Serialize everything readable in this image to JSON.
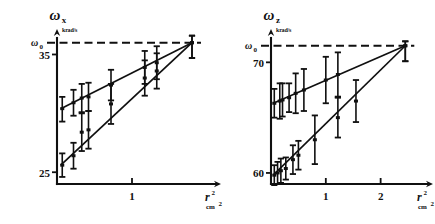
{
  "figure": {
    "title": "",
    "panels": [
      {
        "id": "left",
        "y_axis_name": "ω",
        "y_axis_subscript": "x",
        "y_axis_unit": "krad/s",
        "y_ref_label": "ω",
        "y_ref_subscript": "0",
        "y_tick_label": "35",
        "y_bottom_label": "25",
        "x_axis_name": "r",
        "x_axis_exponent": "2",
        "x_axis_unit": "cm",
        "x_axis_unit_exponent": "2",
        "x_tick_labels": [
          "1"
        ]
      },
      {
        "id": "right",
        "y_axis_name": "ω",
        "y_axis_subscript": "z",
        "y_axis_unit": "krad/s",
        "y_ref_label": "ω",
        "y_ref_subscript": "0",
        "y_tick_label": "70",
        "y_bottom_label": "60",
        "x_axis_name": "r",
        "x_axis_exponent": "2",
        "x_axis_unit": "cm",
        "x_axis_unit_exponent": "2",
        "x_tick_labels": [
          "1",
          "2"
        ]
      }
    ]
  },
  "chart_data": [
    {
      "type": "scatter",
      "id": "left-panel",
      "title": "",
      "xlabel": "r² (cm²)",
      "ylabel": "ωx (krad/s)",
      "xlim": [
        0,
        2.0
      ],
      "ylim": [
        24.0,
        36.4
      ],
      "grid": false,
      "legend": "none",
      "reference_line": {
        "label": "ω0",
        "value": 36.0,
        "style": "dashed",
        "orientation": "horizontal"
      },
      "y_ticks": [
        25,
        35
      ],
      "x_ticks": [
        1
      ],
      "series": [
        {
          "name": "upper-branch",
          "fit_line": {
            "x": [
              0.05,
              1.8
            ],
            "y": [
              30.4,
              36.0
            ]
          },
          "points": [
            {
              "x": 0.07,
              "y": 30.4,
              "yerr_low": 1.1,
              "yerr_high": 1.0
            },
            {
              "x": 0.22,
              "y": 30.9,
              "yerr_low": 1.1,
              "yerr_high": 1.1
            },
            {
              "x": 0.33,
              "y": 31.3,
              "yerr_low": 1.2,
              "yerr_high": 1.2
            },
            {
              "x": 0.42,
              "y": 31.4,
              "yerr_low": 1.2,
              "yerr_high": 1.2
            },
            {
              "x": 0.72,
              "y": 32.4,
              "yerr_low": 1.3,
              "yerr_high": 1.3
            },
            {
              "x": 1.17,
              "y": 33.9,
              "yerr_low": 1.4,
              "yerr_high": 1.4
            },
            {
              "x": 1.33,
              "y": 34.3,
              "yerr_low": 1.4,
              "yerr_high": 1.4
            },
            {
              "x": 1.8,
              "y": 36.0,
              "yerr_low": 1.3,
              "yerr_high": 0.6
            }
          ]
        },
        {
          "name": "lower-branch",
          "fit_line": {
            "x": [
              0.05,
              1.8
            ],
            "y": [
              25.6,
              36.0
            ]
          },
          "points": [
            {
              "x": 0.07,
              "y": 25.6,
              "yerr_low": 1.0,
              "yerr_high": 1.0
            },
            {
              "x": 0.22,
              "y": 26.4,
              "yerr_low": 1.1,
              "yerr_high": 1.1
            },
            {
              "x": 0.33,
              "y": 28.4,
              "yerr_low": 1.6,
              "yerr_high": 1.6
            },
            {
              "x": 0.42,
              "y": 28.6,
              "yerr_low": 1.6,
              "yerr_high": 1.6
            },
            {
              "x": 0.72,
              "y": 30.8,
              "yerr_low": 1.7,
              "yerr_high": 1.7
            },
            {
              "x": 1.17,
              "y": 33.0,
              "yerr_low": 1.5,
              "yerr_high": 1.5
            },
            {
              "x": 1.33,
              "y": 33.6,
              "yerr_low": 1.5,
              "yerr_high": 1.5
            },
            {
              "x": 1.8,
              "y": 36.0,
              "yerr_low": 1.3,
              "yerr_high": 0.6
            }
          ]
        }
      ]
    },
    {
      "type": "scatter",
      "id": "right-panel",
      "title": "",
      "xlabel": "r² (cm²)",
      "ylabel": "ωz (krad/s)",
      "xlim": [
        0,
        2.7
      ],
      "ylim": [
        59.0,
        72.2
      ],
      "grid": false,
      "legend": "none",
      "reference_line": {
        "label": "ω0",
        "value": 71.5,
        "style": "dashed",
        "orientation": "horizontal"
      },
      "y_ticks": [
        60,
        70
      ],
      "x_ticks": [
        1,
        2
      ],
      "series": [
        {
          "name": "upper-branch",
          "fit_line": {
            "x": [
              0.04,
              2.45
            ],
            "y": [
              66.3,
              71.5
            ]
          },
          "points": [
            {
              "x": 0.06,
              "y": 66.3,
              "yerr_low": 1.3,
              "yerr_high": 1.3
            },
            {
              "x": 0.16,
              "y": 66.5,
              "yerr_low": 1.6,
              "yerr_high": 1.6
            },
            {
              "x": 0.21,
              "y": 66.6,
              "yerr_low": 1.5,
              "yerr_high": 1.5
            },
            {
              "x": 0.33,
              "y": 66.8,
              "yerr_low": 1.3,
              "yerr_high": 1.3
            },
            {
              "x": 0.45,
              "y": 67.2,
              "yerr_low": 1.8,
              "yerr_high": 1.8
            },
            {
              "x": 0.6,
              "y": 67.5,
              "yerr_low": 1.9,
              "yerr_high": 1.9
            },
            {
              "x": 1.0,
              "y": 68.4,
              "yerr_low": 2.1,
              "yerr_high": 2.1
            },
            {
              "x": 1.22,
              "y": 68.9,
              "yerr_low": 2.0,
              "yerr_high": 2.0
            },
            {
              "x": 2.45,
              "y": 71.5,
              "yerr_low": 1.4,
              "yerr_high": 0.4
            }
          ]
        },
        {
          "name": "lower-branch",
          "fit_line": {
            "x": [
              0.04,
              2.45
            ],
            "y": [
              59.8,
              71.5
            ]
          },
          "points": [
            {
              "x": 0.06,
              "y": 59.8,
              "yerr_low": 0.9,
              "yerr_high": 0.9
            },
            {
              "x": 0.12,
              "y": 60.0,
              "yerr_low": 1.0,
              "yerr_high": 1.0
            },
            {
              "x": 0.18,
              "y": 60.2,
              "yerr_low": 1.1,
              "yerr_high": 1.1
            },
            {
              "x": 0.27,
              "y": 60.4,
              "yerr_low": 1.0,
              "yerr_high": 1.0
            },
            {
              "x": 0.4,
              "y": 61.2,
              "yerr_low": 1.3,
              "yerr_high": 1.3
            },
            {
              "x": 0.5,
              "y": 61.6,
              "yerr_low": 1.3,
              "yerr_high": 1.3
            },
            {
              "x": 0.8,
              "y": 63.0,
              "yerr_low": 2.2,
              "yerr_high": 2.2
            },
            {
              "x": 1.22,
              "y": 65.0,
              "yerr_low": 1.8,
              "yerr_high": 1.8
            },
            {
              "x": 1.55,
              "y": 66.5,
              "yerr_low": 1.9,
              "yerr_high": 1.9
            },
            {
              "x": 2.45,
              "y": 71.5,
              "yerr_low": 1.4,
              "yerr_high": 0.4
            }
          ]
        }
      ]
    }
  ],
  "style": {
    "ink_color": "#101010",
    "background": "#ffffff"
  }
}
